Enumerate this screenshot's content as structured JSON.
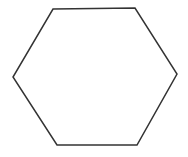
{
  "diagram": {
    "shape": "hexagon",
    "background": "#ffffff",
    "stroke_color": "#333333",
    "fill_color": "#ffffff",
    "stroke_width": 1.5,
    "vertices": [
      [
        53,
        9
      ],
      [
        135,
        8
      ],
      [
        177,
        74
      ],
      [
        137,
        145
      ],
      [
        57,
        145
      ],
      [
        13,
        77
      ]
    ]
  }
}
